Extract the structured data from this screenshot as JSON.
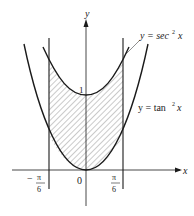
{
  "diagram": {
    "axes": {
      "x_label": "x",
      "y_label": "y",
      "origin_label": "0"
    },
    "curves": [
      {
        "name": "sec2",
        "label": "y = sec² x",
        "label_parts": {
          "lhs": "y = sec",
          "exp": "2",
          "var": "x"
        }
      },
      {
        "name": "tan2",
        "label": "y = tan² x",
        "label_parts": {
          "lhs": "y = tan",
          "exp": "2",
          "var": "x"
        }
      }
    ],
    "y_tick_label": "1",
    "bounds": {
      "left": {
        "sign": "−",
        "num": "π",
        "den": "6"
      },
      "right": {
        "num": "π",
        "den": "6"
      }
    },
    "region": "shaded region between y = sec² x and y = tan² x from x = −π/6 to x = π/6",
    "colors": {
      "stroke": "#1a1a1a",
      "hatch": "#555555",
      "background": "#ffffff"
    }
  }
}
